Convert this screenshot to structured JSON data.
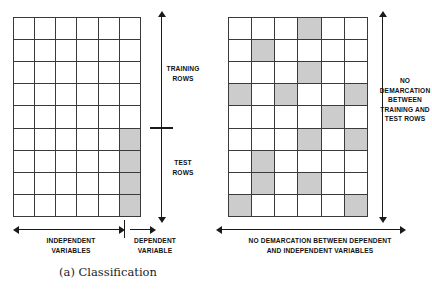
{
  "figure": {
    "panels": [
      {
        "id": "classification",
        "caption": "(a) Classification",
        "grid": {
          "columns": 6,
          "rows": 9,
          "shaded_cells": [
            [
              6,
              6
            ],
            [
              6,
              7
            ],
            [
              6,
              8
            ],
            [
              6,
              9
            ]
          ]
        },
        "vertical_axis": {
          "upper_label": "TRAINING\nROWS",
          "upper_label_line1": "TRAINING",
          "upper_label_line2": "ROWS",
          "lower_label_line1": "TEST",
          "lower_label_line2": "ROWS",
          "divider_after_row": 5
        },
        "horizontal_axis": {
          "left_label_line1": "INDEPENDENT",
          "left_label_line2": "VARIABLES",
          "right_label_line1": "DEPENDENT",
          "right_label_line2": "VARIABLE",
          "divider_after_column": 5
        }
      },
      {
        "id": "matrix-completion",
        "caption": "(b) Matrix completion",
        "grid": {
          "columns": 6,
          "rows": 9,
          "shaded_cells": [
            [
              4,
              1
            ],
            [
              2,
              2
            ],
            [
              4,
              3
            ],
            [
              1,
              4
            ],
            [
              3,
              4
            ],
            [
              6,
              4
            ],
            [
              5,
              5
            ],
            [
              4,
              6
            ],
            [
              6,
              6
            ],
            [
              2,
              7
            ],
            [
              2,
              8
            ],
            [
              4,
              8
            ],
            [
              1,
              9
            ],
            [
              6,
              9
            ]
          ]
        },
        "vertical_axis": {
          "label_line1": "NO",
          "label_line2": "DEMARCATION",
          "label_line3": "BETWEEN",
          "label_line4": "TRAINING AND",
          "label_line5": "TEST ROWS"
        },
        "horizontal_axis": {
          "label_line1": "NO DEMARCATION BETWEEN DEPENDENT",
          "label_line2": "AND INDEPENDENT VARIABLES"
        }
      }
    ],
    "colors": {
      "shaded_cell": "#cccccc",
      "empty_cell": "#ffffff",
      "grid_line": "#3a3a3a",
      "arrow": "#1a1a1a",
      "text": "#111111",
      "background": "#ffffff"
    }
  }
}
